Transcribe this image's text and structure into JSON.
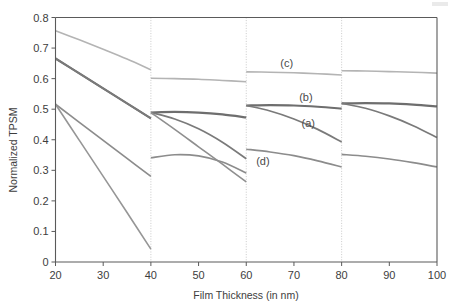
{
  "chart_data": {
    "type": "line",
    "title": "",
    "xlabel": "Film Thickness (in nm)",
    "ylabel": "Normalized TPSM",
    "xlim": [
      20,
      100
    ],
    "ylim": [
      0,
      0.8
    ],
    "xticks": [
      20,
      30,
      40,
      50,
      60,
      70,
      80,
      90,
      100
    ],
    "xtick_labels": [
      "20",
      "30",
      "40",
      "50",
      "60",
      "70",
      "80",
      "90",
      "100"
    ],
    "yticks": [
      0,
      0.1,
      0.2,
      0.3,
      0.4,
      0.5,
      0.6,
      0.7,
      0.8
    ],
    "ytick_labels": [
      "0",
      "0.1",
      "0.2",
      "0.3",
      "0.4",
      "0.5",
      "0.6",
      "0.7",
      "0.8"
    ],
    "grid": false,
    "legend": "inline-annotations",
    "segment_breaks": [
      40,
      60,
      80
    ],
    "annotations": [
      {
        "text": "(c)",
        "x": 68.5,
        "y": 0.638
      },
      {
        "text": "(b)",
        "x": 72.5,
        "y": 0.527
      },
      {
        "text": "(a)",
        "x": 73.0,
        "y": 0.443
      },
      {
        "text": "(d)",
        "x": 63.5,
        "y": 0.318
      }
    ],
    "series": [
      {
        "name": "(c)",
        "color": "#b4b4b4",
        "width": 1.6,
        "segments": [
          {
            "x": [
              20,
              25,
              30,
              35,
              40
            ],
            "y": [
              0.757,
              0.727,
              0.696,
              0.664,
              0.629
            ]
          },
          {
            "x": [
              40,
              45,
              50,
              55,
              60
            ],
            "y": [
              0.601,
              0.6,
              0.598,
              0.594,
              0.59
            ]
          },
          {
            "x": [
              60,
              65,
              70,
              75,
              80
            ],
            "y": [
              0.622,
              0.621,
              0.619,
              0.616,
              0.612
            ]
          },
          {
            "x": [
              80,
              85,
              90,
              95,
              100
            ],
            "y": [
              0.626,
              0.625,
              0.623,
              0.621,
              0.618
            ]
          }
        ]
      },
      {
        "name": "(b)",
        "color": "#6e6e6e",
        "width": 2.2,
        "segments": [
          {
            "x": [
              20,
              25,
              30,
              35,
              40
            ],
            "y": [
              0.666,
              0.617,
              0.568,
              0.519,
              0.47
            ]
          },
          {
            "x": [
              40,
              45,
              50,
              55,
              60
            ],
            "y": [
              0.489,
              0.491,
              0.489,
              0.483,
              0.473
            ]
          },
          {
            "x": [
              60,
              65,
              70,
              75,
              80
            ],
            "y": [
              0.512,
              0.513,
              0.512,
              0.508,
              0.502
            ]
          },
          {
            "x": [
              80,
              85,
              90,
              95,
              100
            ],
            "y": [
              0.519,
              0.52,
              0.519,
              0.515,
              0.509
            ]
          }
        ]
      },
      {
        "name": "(a)",
        "color": "#7a7a7a",
        "width": 1.7,
        "segments": [
          {
            "x": [
              20,
              25,
              30,
              35,
              40
            ],
            "y": [
              0.666,
              0.617,
              0.568,
              0.519,
              0.47
            ]
          },
          {
            "x": [
              40,
              45,
              50,
              55,
              60
            ],
            "y": [
              0.489,
              0.468,
              0.436,
              0.392,
              0.338
            ]
          },
          {
            "x": [
              60,
              65,
              70,
              75,
              80
            ],
            "y": [
              0.512,
              0.494,
              0.468,
              0.434,
              0.393
            ]
          },
          {
            "x": [
              80,
              85,
              90,
              95,
              100
            ],
            "y": [
              0.519,
              0.503,
              0.478,
              0.446,
              0.407
            ]
          }
        ]
      },
      {
        "name": "(d)",
        "color": "#8c8c8c",
        "width": 1.7,
        "segments": [
          {
            "x": [
              20,
              25,
              30,
              35,
              40
            ],
            "y": [
              0.516,
              0.457,
              0.398,
              0.339,
              0.28
            ]
          },
          {
            "x": [
              40,
              45,
              50,
              55,
              60
            ],
            "y": [
              0.341,
              0.351,
              0.347,
              0.327,
              0.291
            ]
          },
          {
            "x": [
              60,
              65,
              70,
              75,
              80
            ],
            "y": [
              0.369,
              0.36,
              0.348,
              0.331,
              0.311
            ]
          },
          {
            "x": [
              80,
              85,
              90,
              95,
              100
            ],
            "y": [
              0.352,
              0.346,
              0.337,
              0.325,
              0.311
            ]
          }
        ]
      },
      {
        "name": "(e)",
        "color": "#969696",
        "width": 1.6,
        "segments": [
          {
            "x": [
              20,
              25,
              30,
              35,
              40
            ],
            "y": [
              0.516,
              0.398,
              0.28,
              0.162,
              0.042
            ]
          }
        ]
      },
      {
        "name": "(f)",
        "color": "#8f8f8f",
        "width": 1.6,
        "segments": [
          {
            "x": [
              40,
              45,
              50,
              55,
              60
            ],
            "y": [
              0.489,
              0.434,
              0.377,
              0.32,
              0.262
            ]
          }
        ]
      }
    ]
  },
  "figure": {
    "axis_color": "#5a5a5a",
    "background": "#ffffff"
  }
}
